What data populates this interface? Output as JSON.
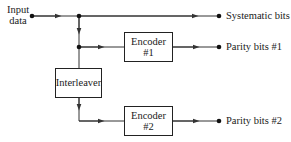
{
  "diagram": {
    "input": {
      "label_line1": "Input",
      "label_line2": "data"
    },
    "blocks": [
      {
        "id": "encoder1",
        "line1": "Encoder",
        "line2": "#1"
      },
      {
        "id": "interleaver",
        "line1": "Interleaver"
      },
      {
        "id": "encoder2",
        "line1": "Encoder",
        "line2": "#2"
      }
    ],
    "outputs": [
      {
        "id": "systematic",
        "label": "Systematic bits"
      },
      {
        "id": "parity1",
        "label": "Parity bits #1"
      },
      {
        "id": "parity2",
        "label": "Parity bits #2"
      }
    ],
    "colors": {
      "line": "#333333",
      "box_border": "#222222",
      "background": "#ffffff"
    }
  }
}
